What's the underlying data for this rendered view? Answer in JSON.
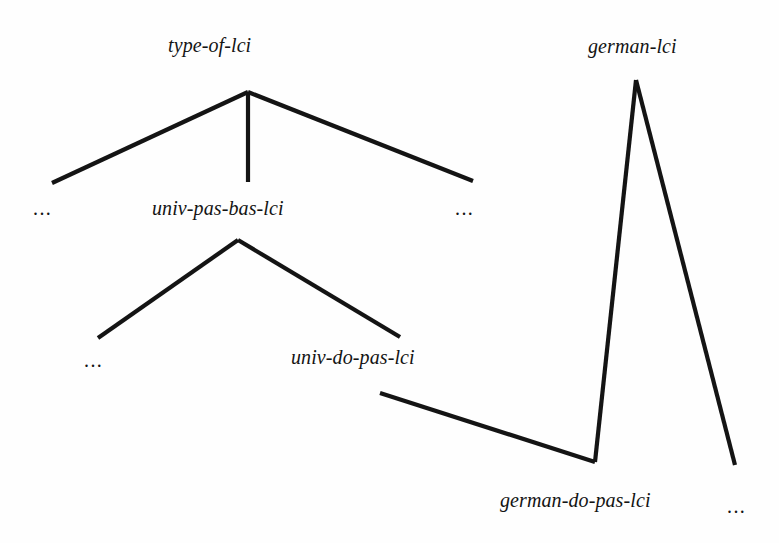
{
  "figure": {
    "kind": "type-hierarchy-tree-diagram",
    "background_color": "#fefefe",
    "stroke_color": "#141414",
    "text_color": "#141414",
    "width": 779,
    "height": 543
  },
  "nodes": [
    {
      "id": "type-of-lci",
      "label": "type-of-lci",
      "x": 168,
      "y": 35,
      "apex_x": 248,
      "apex_y": 92
    },
    {
      "id": "univ-pas-bas-lci",
      "label": "univ-pas-bas-lci",
      "x": 152,
      "y": 198,
      "apex_x": 238,
      "apex_y": 240
    },
    {
      "id": "univ-do-pas-lci",
      "label": "univ-do-pas-lci",
      "x": 291,
      "y": 347,
      "apex_x": 400,
      "apex_y": 337
    },
    {
      "id": "german-lci",
      "label": "german-lci",
      "x": 588,
      "y": 36,
      "apex_x": 636,
      "apex_y": 80
    },
    {
      "id": "german-do-pas-lci",
      "label": "german-do-pas-lci",
      "x": 500,
      "y": 490,
      "apex_x": 595,
      "apex_y": 462
    }
  ],
  "ellipses": [
    {
      "id": "ellipsis-top-left",
      "label": "...",
      "x": 33,
      "y": 198
    },
    {
      "id": "ellipsis-top-right",
      "label": "...",
      "x": 455,
      "y": 198
    },
    {
      "id": "ellipsis-mid-left",
      "label": "...",
      "x": 84,
      "y": 350
    },
    {
      "id": "ellipsis-bottom-right",
      "label": "...",
      "x": 727,
      "y": 496
    }
  ],
  "edges": [
    {
      "id": "edge-type-of-lci-left",
      "points": "52,183 248,92"
    },
    {
      "id": "edge-type-of-lci-middle",
      "points": "248,92 248,182"
    },
    {
      "id": "edge-type-of-lci-right",
      "points": "248,92 473,181"
    },
    {
      "id": "edge-univ-pas-bas-lci-left",
      "points": "98,338 238,240"
    },
    {
      "id": "edge-univ-pas-bas-lci-right",
      "points": "238,240 400,337"
    },
    {
      "id": "edge-univ-do-pas-to-german-do-pas",
      "points": "380,393 595,462"
    },
    {
      "id": "edge-german-lci-left",
      "points": "595,462 636,80"
    },
    {
      "id": "edge-german-lci-right",
      "points": "636,80 735,465"
    }
  ],
  "stroke_width": 4.2
}
